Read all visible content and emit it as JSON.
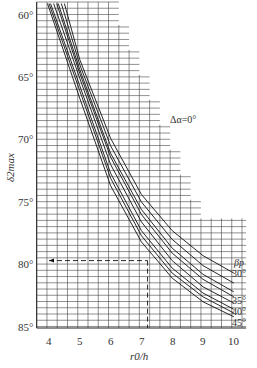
{
  "chart_data": {
    "type": "line",
    "title": "",
    "annotation": "Δα=0°",
    "xlabel": "r0/h",
    "ylabel": "δ2max",
    "x_ticks": [
      "4",
      "5",
      "6",
      "7",
      "8",
      "9",
      "10"
    ],
    "y_ticks": [
      "60°",
      "65°",
      "70°",
      "75°",
      "80°",
      "85°"
    ],
    "xlim": [
      3.6,
      10.4
    ],
    "ylim": [
      59,
      86
    ],
    "y_inverted": true,
    "grid": true,
    "legend_title": "βp",
    "legend_position": "right",
    "series": [
      {
        "name": "30°",
        "x": [
          4.5,
          5,
          6,
          7,
          8,
          9,
          10
        ],
        "y": [
          59,
          63.5,
          69.8,
          74.3,
          77.2,
          79.2,
          80.6
        ]
      },
      {
        "name": "32°",
        "x": [
          4.4,
          5,
          6,
          7,
          8,
          9,
          10
        ],
        "y": [
          59,
          63.9,
          70.4,
          74.9,
          77.9,
          80.0,
          81.4
        ]
      },
      {
        "name": "34°",
        "x": [
          4.3,
          5,
          6,
          7,
          8,
          9,
          10
        ],
        "y": [
          59,
          64.3,
          71.0,
          75.5,
          78.6,
          80.7,
          82.1
        ]
      },
      {
        "name": "35°",
        "x": [
          4.25,
          5,
          6,
          7,
          8,
          9,
          10
        ],
        "y": [
          59,
          64.6,
          71.3,
          75.9,
          79.0,
          81.1,
          82.5
        ]
      },
      {
        "name": "37°",
        "x": [
          4.15,
          5,
          6,
          7,
          8,
          9,
          10
        ],
        "y": [
          59,
          65.0,
          71.9,
          76.5,
          79.6,
          81.7,
          83.0
        ]
      },
      {
        "name": "40°",
        "x": [
          4.05,
          5,
          6,
          7,
          8,
          9,
          10
        ],
        "y": [
          59,
          65.6,
          72.6,
          77.2,
          80.2,
          82.2,
          83.5
        ]
      },
      {
        "name": "42°",
        "x": [
          4.0,
          5,
          6,
          7,
          8,
          9,
          10
        ],
        "y": [
          59,
          66.0,
          73.0,
          77.6,
          80.6,
          82.5,
          83.8
        ]
      },
      {
        "name": "45°",
        "x": [
          3.95,
          5,
          6,
          7,
          8,
          9,
          10
        ],
        "y": [
          59,
          66.6,
          73.6,
          78.1,
          81.0,
          82.9,
          84.1
        ]
      }
    ],
    "reference_lines": [
      {
        "type": "horizontal_dashed",
        "y": 79.6,
        "x_from": 4.0,
        "x_to": 7.2
      },
      {
        "type": "vertical_dashed",
        "x": 7.2,
        "y_from": 79.6,
        "y_to": 85
      }
    ]
  }
}
